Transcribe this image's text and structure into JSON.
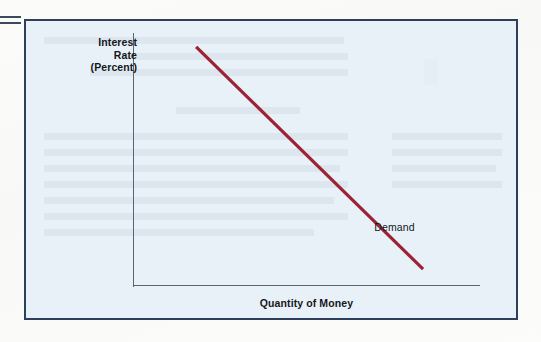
{
  "figure": {
    "frame_border_color": "#2e3f5c",
    "panel_background_color": "#e9f1f8",
    "page_background_color": "#fdfdfb",
    "crop_mark_name": "equals-crop-mark"
  },
  "chart_data": {
    "type": "line",
    "title": "",
    "subtitle": "",
    "xlabel": "Quantity of Money",
    "ylabel": "Interest Rate (Percent)",
    "ylabel_lines": [
      "Interest",
      "Rate",
      "(Percent)"
    ],
    "grid": false,
    "legend_position": "inline-annotation",
    "axis_color": "#5b6470",
    "xlim": [
      0,
      1
    ],
    "ylim": [
      0,
      1
    ],
    "xticks": [],
    "yticks": [],
    "xticklabels": [],
    "yticklabels": [],
    "series": [
      {
        "name": "Demand",
        "color": "#9b2335",
        "line_width": 3.2,
        "x": [
          0.182,
          0.836
        ],
        "y": [
          0.945,
          0.063
        ],
        "annotation": "Demand"
      }
    ],
    "annotations": [
      {
        "text": "Demand",
        "x": 0.73,
        "y": 0.205,
        "color": "#15171c",
        "bold": false
      }
    ]
  }
}
